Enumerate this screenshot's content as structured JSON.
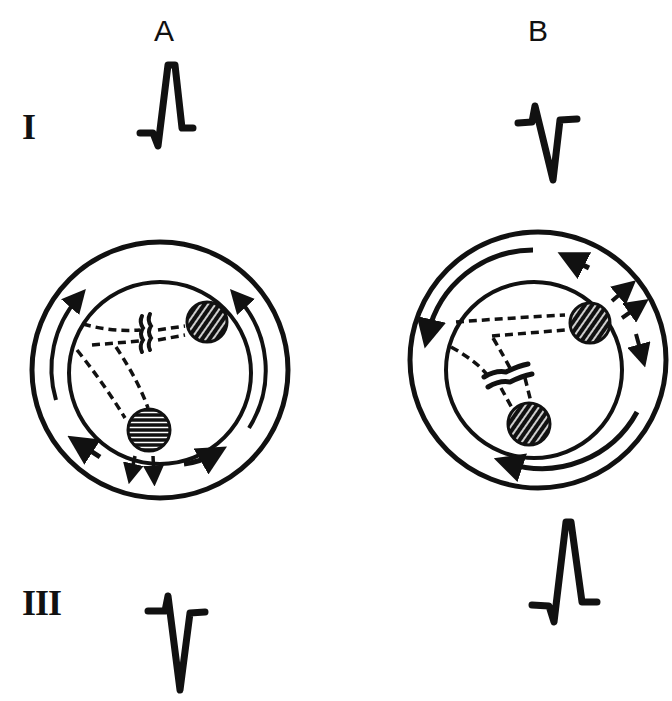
{
  "columns": [
    {
      "id": "A",
      "label": "A"
    },
    {
      "id": "B",
      "label": "B"
    }
  ],
  "rows": [
    {
      "id": "I",
      "label": "I"
    },
    {
      "id": "III",
      "label": "III"
    }
  ],
  "panels": {
    "A": {
      "lead_I_complex": "positive (upright R wave)",
      "lead_III_complex": "negative (deep S wave)",
      "block_location": "upper fascicle pathway",
      "activation_direction": "counterclockwise, spreading upward from inferior site"
    },
    "B": {
      "lead_I_complex": "negative (deep S wave)",
      "lead_III_complex": "positive (upright R wave)",
      "block_location": "lower fascicle pathway",
      "activation_direction": "spreading from superior site leftward and downward"
    }
  },
  "colors": {
    "ink": "#111111",
    "background": "#ffffff"
  }
}
